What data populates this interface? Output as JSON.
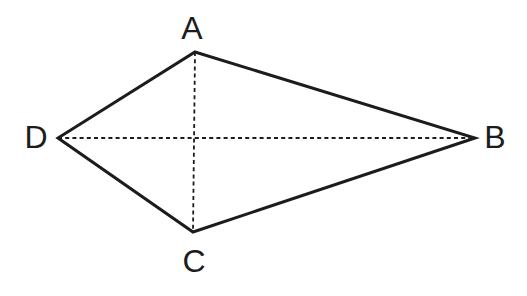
{
  "figure": {
    "background_color": "#ffffff",
    "stroke_color": "#1c1c1c",
    "label_color": "#1c1c1c",
    "label_font_size": 32,
    "solid_stroke_width": 3,
    "dashed_stroke_width": 1.8,
    "dash_pattern": "4 3.2",
    "vertices": [
      {
        "id": "A",
        "label": "A",
        "x": 195,
        "y": 52,
        "label_x": 192,
        "label_y": 28
      },
      {
        "id": "B",
        "label": "B",
        "x": 475,
        "y": 138,
        "label_x": 495,
        "label_y": 137
      },
      {
        "id": "C",
        "label": "C",
        "x": 193,
        "y": 232,
        "label_x": 194,
        "label_y": 261
      },
      {
        "id": "D",
        "label": "D",
        "x": 58,
        "y": 138,
        "label_x": 36,
        "label_y": 137
      }
    ],
    "outline": [
      "A",
      "B",
      "C",
      "D"
    ],
    "diagonals": [
      [
        "A",
        "C"
      ],
      [
        "D",
        "B"
      ]
    ]
  }
}
